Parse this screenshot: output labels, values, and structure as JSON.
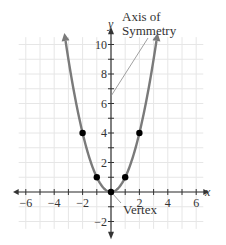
{
  "chart_data": {
    "type": "line",
    "title": "",
    "xlabel": "x",
    "ylabel": "y",
    "xlim": [
      -6.5,
      6.5
    ],
    "ylim": [
      -2.7,
      10.7
    ],
    "grid": true,
    "x_ticks": [
      -6,
      -5,
      -4,
      -3,
      -2,
      -1,
      1,
      2,
      3,
      4,
      5,
      6
    ],
    "x_tick_labels": [
      "−6",
      "−4",
      "−2",
      "2",
      "4",
      "6"
    ],
    "x_tick_label_values": [
      -6,
      -4,
      -2,
      2,
      4,
      6
    ],
    "y_ticks": [
      -2,
      -1,
      1,
      2,
      3,
      4,
      5,
      6,
      7,
      8,
      9,
      10
    ],
    "y_tick_labels": [
      "−2",
      "2",
      "4",
      "6",
      "8",
      "10"
    ],
    "y_tick_label_values": [
      -2,
      2,
      4,
      6,
      8,
      10
    ],
    "series": [
      {
        "name": "y = x^2",
        "function": "x^2",
        "x_range": [
          -3.2,
          3.2
        ],
        "color": "#7a7a7a",
        "arrows_at_ends": true
      },
      {
        "name": "plotted points",
        "type": "scatter",
        "x": [
          -2,
          -1,
          0,
          1,
          2
        ],
        "y": [
          4,
          1,
          0,
          1,
          4
        ],
        "color": "#000000"
      }
    ],
    "annotations": [
      {
        "text_lines": [
          "Axis of",
          "Symmetry"
        ],
        "points_to": [
          0,
          6.5
        ]
      },
      {
        "text_lines": [
          "Vertex"
        ],
        "points_to": [
          0,
          0
        ]
      }
    ]
  },
  "labels": {
    "x_axis": "x",
    "y_axis": "y",
    "axis_of_symmetry_line1": "Axis of",
    "axis_of_symmetry_line2": "Symmetry",
    "vertex": "Vertex"
  },
  "colors": {
    "curve": "#7a7a7a",
    "points": "#000000",
    "axes": "#333333",
    "grid": "#e6e6e6",
    "leader": "#888888"
  }
}
